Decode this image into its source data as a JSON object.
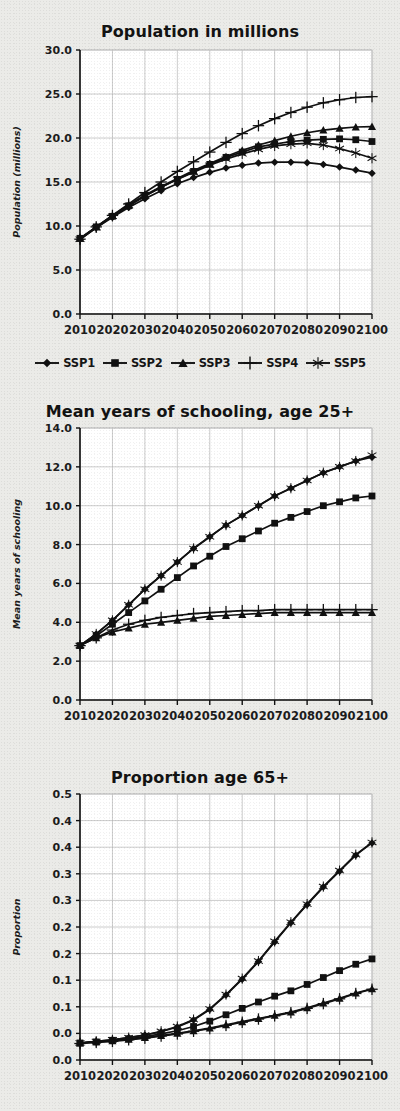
{
  "figure": {
    "background_color": "#ebebe8",
    "ink_color": "#111111",
    "grid_color": "#bfbfbf"
  },
  "legend": {
    "items": [
      {
        "label": "SSP1",
        "marker": "diamond"
      },
      {
        "label": "SSP2",
        "marker": "square"
      },
      {
        "label": "SSP3",
        "marker": "triangle"
      },
      {
        "label": "SSP4",
        "marker": "plus"
      },
      {
        "label": "SSP5",
        "marker": "asterisk"
      }
    ]
  },
  "chart_data": [
    {
      "type": "line",
      "title": "Population in millions",
      "xlabel": "",
      "ylabel": "Population (millions)",
      "xlim": [
        2010,
        2100
      ],
      "ylim": [
        0.0,
        30.0
      ],
      "yticks": [
        0.0,
        5.0,
        10.0,
        15.0,
        20.0,
        25.0,
        30.0
      ],
      "yticklabels": [
        "0.0",
        "5.0",
        "10.0",
        "15.0",
        "20.0",
        "25.0",
        "30.0"
      ],
      "xticks": [
        2010,
        2020,
        2030,
        2040,
        2050,
        2060,
        2070,
        2080,
        2090,
        2100
      ],
      "xticklabels": [
        "2010",
        "2020",
        "2030",
        "2040",
        "2050",
        "2060",
        "2070",
        "2080",
        "2090",
        "2100"
      ],
      "grid": true,
      "legend_position": "below",
      "x": [
        2010,
        2015,
        2020,
        2025,
        2030,
        2035,
        2040,
        2045,
        2050,
        2055,
        2060,
        2065,
        2070,
        2075,
        2080,
        2085,
        2090,
        2095,
        2100
      ],
      "series": [
        {
          "name": "SSP1",
          "marker": "diamond",
          "values": [
            8.5,
            9.8,
            11.0,
            12.1,
            13.1,
            14.0,
            14.8,
            15.5,
            16.1,
            16.6,
            16.9,
            17.15,
            17.25,
            17.25,
            17.2,
            17.0,
            16.7,
            16.35,
            16.0
          ]
        },
        {
          "name": "SSP2",
          "marker": "square",
          "values": [
            8.6,
            9.9,
            11.1,
            12.3,
            13.4,
            14.4,
            15.3,
            16.2,
            17.0,
            17.8,
            18.4,
            19.0,
            19.3,
            19.6,
            19.75,
            19.85,
            19.9,
            19.8,
            19.6
          ]
        },
        {
          "name": "SSP3",
          "marker": "triangle",
          "values": [
            8.6,
            9.9,
            11.2,
            12.4,
            13.5,
            14.5,
            15.4,
            16.3,
            17.1,
            17.9,
            18.6,
            19.2,
            19.7,
            20.2,
            20.6,
            20.9,
            21.1,
            21.25,
            21.3
          ]
        },
        {
          "name": "SSP4",
          "marker": "plus",
          "values": [
            8.5,
            9.9,
            11.2,
            12.5,
            13.8,
            15.0,
            16.2,
            17.3,
            18.4,
            19.5,
            20.5,
            21.4,
            22.2,
            22.9,
            23.5,
            24.0,
            24.35,
            24.6,
            24.7
          ]
        },
        {
          "name": "SSP5",
          "marker": "asterisk",
          "values": [
            8.5,
            9.8,
            11.1,
            12.3,
            13.4,
            14.4,
            15.3,
            16.1,
            16.9,
            17.6,
            18.2,
            18.7,
            19.1,
            19.3,
            19.4,
            19.2,
            18.8,
            18.3,
            17.7
          ]
        }
      ]
    },
    {
      "type": "line",
      "title": "Mean years of schooling, age 25+",
      "xlabel": "",
      "ylabel": "Mean years of schooling",
      "xlim": [
        2010,
        2100
      ],
      "ylim": [
        0.0,
        14.0
      ],
      "yticks": [
        0.0,
        2.0,
        4.0,
        6.0,
        8.0,
        10.0,
        12.0,
        14.0
      ],
      "yticklabels": [
        "0.0",
        "2.0",
        "4.0",
        "6.0",
        "8.0",
        "10.0",
        "12.0",
        "14.0"
      ],
      "xticks": [
        2010,
        2020,
        2030,
        2040,
        2050,
        2060,
        2070,
        2080,
        2090,
        2100
      ],
      "xticklabels": [
        "2010",
        "2020",
        "2030",
        "2040",
        "2050",
        "2060",
        "2070",
        "2080",
        "2090",
        "2100"
      ],
      "grid": true,
      "legend_position": "none",
      "x": [
        2010,
        2015,
        2020,
        2025,
        2030,
        2035,
        2040,
        2045,
        2050,
        2055,
        2060,
        2065,
        2070,
        2075,
        2080,
        2085,
        2090,
        2095,
        2100
      ],
      "series": [
        {
          "name": "SSP1",
          "marker": "diamond",
          "values": [
            2.8,
            3.4,
            4.1,
            4.9,
            5.7,
            6.4,
            7.1,
            7.8,
            8.4,
            9.0,
            9.5,
            10.0,
            10.5,
            10.9,
            11.3,
            11.7,
            12.0,
            12.3,
            12.5
          ]
        },
        {
          "name": "SSP2",
          "marker": "square",
          "values": [
            2.8,
            3.3,
            3.9,
            4.5,
            5.1,
            5.7,
            6.3,
            6.9,
            7.4,
            7.9,
            8.3,
            8.7,
            9.1,
            9.4,
            9.7,
            10.0,
            10.2,
            10.4,
            10.5
          ]
        },
        {
          "name": "SSP3",
          "marker": "triangle",
          "values": [
            2.8,
            3.2,
            3.5,
            3.7,
            3.9,
            4.0,
            4.1,
            4.2,
            4.3,
            4.35,
            4.4,
            4.45,
            4.5,
            4.5,
            4.5,
            4.5,
            4.5,
            4.5,
            4.5
          ]
        },
        {
          "name": "SSP4",
          "marker": "plus",
          "values": [
            2.8,
            3.2,
            3.6,
            3.9,
            4.1,
            4.25,
            4.35,
            4.45,
            4.5,
            4.55,
            4.6,
            4.6,
            4.65,
            4.65,
            4.65,
            4.65,
            4.65,
            4.65,
            4.65
          ]
        },
        {
          "name": "SSP5",
          "marker": "asterisk",
          "values": [
            2.8,
            3.4,
            4.1,
            4.9,
            5.7,
            6.4,
            7.1,
            7.8,
            8.4,
            9.0,
            9.5,
            10.0,
            10.5,
            10.9,
            11.3,
            11.7,
            12.0,
            12.3,
            12.6
          ]
        }
      ]
    },
    {
      "type": "line",
      "title": "Proportion age 65+",
      "xlabel": "",
      "ylabel": "Proportion",
      "xlim": [
        2010,
        2100
      ],
      "ylim": [
        0.0,
        0.5
      ],
      "yticks": [
        0.0,
        0.05,
        0.1,
        0.15,
        0.2,
        0.25,
        0.3,
        0.35,
        0.4,
        0.45,
        0.5
      ],
      "yticklabels": [
        "0.0",
        "0.1",
        "0.1",
        "0.2",
        "0.2",
        "0.3",
        "0.3",
        "0.4",
        "0.4",
        "0.5"
      ],
      "xticks": [
        2010,
        2020,
        2030,
        2040,
        2050,
        2060,
        2070,
        2080,
        2090,
        2100
      ],
      "xticklabels": [
        "2010",
        "2020",
        "2030",
        "2040",
        "2050",
        "2060",
        "2070",
        "2080",
        "2090",
        "2100"
      ],
      "grid": true,
      "legend_position": "none",
      "x": [
        2010,
        2015,
        2020,
        2025,
        2030,
        2035,
        2040,
        2045,
        2050,
        2055,
        2060,
        2065,
        2070,
        2075,
        2080,
        2085,
        2090,
        2095,
        2100
      ],
      "series": [
        {
          "name": "SSP1",
          "marker": "diamond",
          "values": [
            0.032,
            0.035,
            0.038,
            0.042,
            0.047,
            0.053,
            0.062,
            0.075,
            0.095,
            0.122,
            0.152,
            0.185,
            0.222,
            0.258,
            0.292,
            0.325,
            0.355,
            0.385,
            0.408
          ]
        },
        {
          "name": "SSP2",
          "marker": "square",
          "values": [
            0.032,
            0.034,
            0.037,
            0.04,
            0.044,
            0.049,
            0.055,
            0.063,
            0.073,
            0.085,
            0.097,
            0.109,
            0.12,
            0.13,
            0.142,
            0.155,
            0.168,
            0.18,
            0.19
          ]
        },
        {
          "name": "SSP3",
          "marker": "triangle",
          "values": [
            0.032,
            0.034,
            0.036,
            0.039,
            0.042,
            0.046,
            0.05,
            0.055,
            0.06,
            0.066,
            0.072,
            0.078,
            0.084,
            0.09,
            0.098,
            0.107,
            0.116,
            0.126,
            0.134
          ]
        },
        {
          "name": "SSP4",
          "marker": "plus",
          "values": [
            0.031,
            0.033,
            0.035,
            0.038,
            0.041,
            0.045,
            0.049,
            0.054,
            0.059,
            0.065,
            0.071,
            0.077,
            0.083,
            0.089,
            0.097,
            0.106,
            0.115,
            0.125,
            0.133
          ]
        },
        {
          "name": "SSP5",
          "marker": "asterisk",
          "values": [
            0.032,
            0.035,
            0.038,
            0.042,
            0.047,
            0.054,
            0.063,
            0.076,
            0.096,
            0.123,
            0.153,
            0.186,
            0.223,
            0.259,
            0.293,
            0.326,
            0.356,
            0.386,
            0.409
          ]
        }
      ]
    }
  ]
}
